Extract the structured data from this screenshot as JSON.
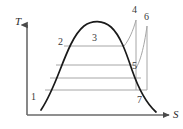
{
  "figure": {
    "kind": "temperature-entropy-cycle-diagram",
    "width": 183,
    "height": 129,
    "background": "#ffffff"
  },
  "axes": {
    "vertical": {
      "label": "T",
      "name": "temperature-axis",
      "color": "#5a5a5a",
      "x": 27,
      "y_top": 24,
      "y_bottom": 115,
      "label_x": 15,
      "label_y": 17
    },
    "horizontal": {
      "label": "S",
      "name": "entropy-axis",
      "color": "#5a5a5a",
      "y": 115,
      "x_left": 27,
      "x_right": 170,
      "label_x": 173,
      "label_y": 110
    }
  },
  "curves": {
    "saturation_dome": {
      "name": "saturation-dome",
      "color": "#1a1a1a",
      "stroke_width": 1.7,
      "path": "M 41,110 C 47,101 53,88 60,70 C 67,52 74,34 84,26 C 92,20 103,20 111,27 C 120,35 126,52 132,70 C 139,90 147,104 156,112"
    },
    "expansion_4_5": {
      "name": "expansion-line-4-5",
      "color": "#a6a6a6",
      "stroke_width": 1.0,
      "path": "M 136,20 L 136,90"
    },
    "expansion_6_7": {
      "name": "expansion-line-6-7",
      "color": "#a6a6a6",
      "stroke_width": 1.0,
      "path": "M 147,26 L 147,90"
    },
    "reheat_5_6": {
      "name": "reheat-curve-5-6",
      "color": "#a6a6a6",
      "stroke_width": 1.0,
      "path": "M 136,68 C 140,62 144,48 147,26"
    },
    "superheat_3_4": {
      "name": "superheat-curve-3-4",
      "color": "#a6a6a6",
      "stroke_width": 1.0,
      "path": "M 124,46 C 129,40 133,31 136,20"
    }
  },
  "isobars": [
    {
      "name": "isobar-2-3",
      "y": 46,
      "x1": 64,
      "x2": 124,
      "color": "#a6a6a6"
    },
    {
      "name": "isobar-mid-upper",
      "y": 65,
      "x1": 56,
      "x2": 136,
      "color": "#a6a6a6"
    },
    {
      "name": "isobar-mid-lower",
      "y": 78,
      "x1": 50,
      "x2": 141,
      "color": "#a6a6a6"
    },
    {
      "name": "isobar-1-7",
      "y": 90,
      "x1": 45,
      "x2": 147,
      "color": "#a6a6a6"
    }
  ],
  "state_points": [
    {
      "id": "1",
      "label": "1",
      "name": "state-point-1",
      "x": 31,
      "y": 92
    },
    {
      "id": "2",
      "label": "2",
      "name": "state-point-2",
      "x": 58,
      "y": 37
    },
    {
      "id": "3",
      "label": "3",
      "name": "state-point-3",
      "x": 92,
      "y": 33
    },
    {
      "id": "4",
      "label": "4",
      "name": "state-point-4",
      "x": 132,
      "y": 6
    },
    {
      "id": "5",
      "label": "5",
      "name": "state-point-5",
      "x": 132,
      "y": 62
    },
    {
      "id": "6",
      "label": "6",
      "name": "state-point-6",
      "x": 144,
      "y": 13
    },
    {
      "id": "7",
      "label": "7",
      "name": "state-point-7",
      "x": 137,
      "y": 96
    }
  ]
}
